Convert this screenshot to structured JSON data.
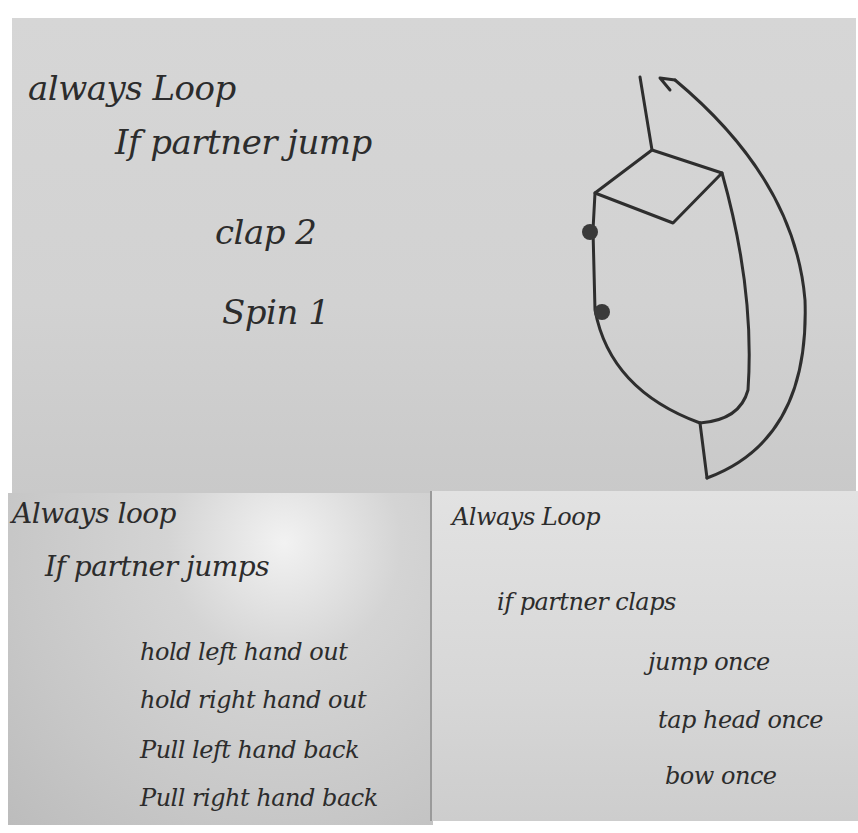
{
  "photo": {
    "description": "Photograph of three handwritten paper notes with simple pseudo-code dance instructions",
    "colors": {
      "ink": "#2c2c2c",
      "paper_top": "#d4d4d4",
      "paper_bottom_left": "#c9c9c9",
      "paper_bottom_right": "#dadada"
    }
  },
  "top_note": {
    "lines": [
      "always Loop",
      "If partner jump",
      "clap 2",
      "Spin 1"
    ],
    "diagram": {
      "description": "Hand-drawn loop/flow shape: block with two dots and an arrow curving back to the top",
      "icon": "loop-arrow-icon"
    }
  },
  "bottom_left_note": {
    "lines": [
      "Always loop",
      "If partner jumps",
      "hold left hand out",
      "hold right hand out",
      "Pull left hand back",
      "Pull right hand back"
    ]
  },
  "bottom_right_note": {
    "lines": [
      "Always Loop",
      "if partner claps",
      "jump once",
      "tap head once",
      "bow once"
    ]
  }
}
